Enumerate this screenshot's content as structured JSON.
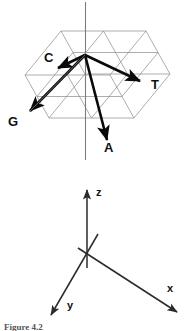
{
  "figure": {
    "caption": "Figure 4.2",
    "panels": {
      "top": {
        "name": "nucleotide-tetrahedron",
        "vectors": [
          {
            "id": "C",
            "label": "C",
            "label_x": 44,
            "label_y": 62,
            "tip_x": 30,
            "tip_y": 111
          },
          {
            "id": "T",
            "label": "T",
            "label_x": 151,
            "label_y": 89,
            "tip_x": 140,
            "tip_y": 81
          },
          {
            "id": "G",
            "label": "G",
            "label_x": 8,
            "label_y": 126,
            "tip_x": 30,
            "tip_y": 111
          },
          {
            "id": "A",
            "label": "A",
            "label_x": 104,
            "label_y": 152,
            "tip_x": 107,
            "tip_y": 140
          }
        ],
        "origin_x": 85,
        "origin_y": 55,
        "vertical_axis_top_y": 2,
        "vertical_axis_bottom_y": 160
      },
      "bottom": {
        "name": "coordinate-axes",
        "origin_x": 87,
        "origin_y": 253,
        "axes": [
          {
            "id": "z",
            "label": "z",
            "label_x": 96,
            "label_y": 196
          },
          {
            "id": "x",
            "label": "x",
            "label_x": 167,
            "label_y": 292
          },
          {
            "id": "y",
            "label": "y",
            "label_x": 67,
            "label_y": 309
          }
        ]
      }
    },
    "colors": {
      "vector": "#0a0a0a",
      "grid": "#8a8a8a",
      "axis": "#2b2b2b",
      "vertical_axis": "#7d7d7d",
      "background": "#ffffff",
      "caption": "#555555"
    }
  }
}
